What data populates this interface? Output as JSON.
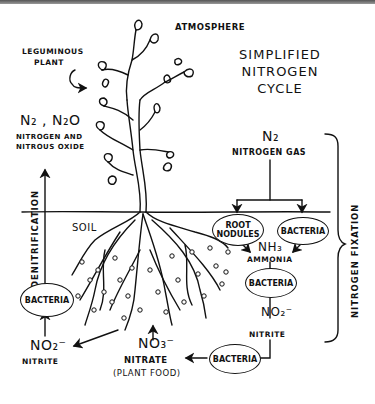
{
  "diagram": {
    "title": "SIMPLIFIED NITROGEN CYCLE",
    "title_lines": [
      "SIMPLIFIED",
      "NITROGEN",
      "CYCLE"
    ],
    "labels": {
      "atmosphere": "ATMOSPHERE",
      "leguminous_plant_1": "LEGUMINOUS",
      "leguminous_plant_2": "PLANT",
      "soil": "SOIL",
      "n2_n2o": "N₂ , N₂O",
      "n2_n2o_name_1": "NITROGEN AND",
      "n2_n2o_name_2": "NITROUS OXIDE",
      "n2": "N₂",
      "n2_name": "NITROGEN GAS",
      "nh3": "NH₃",
      "nh3_name": "AMMONIA",
      "no2_right": "NO₂⁻",
      "no2_right_name": "NITRITE",
      "no2_left": "NO₂⁻",
      "no2_left_name": "NITRITE",
      "no3": "NO₃⁻",
      "no3_name": "NITRATE",
      "no3_note": "(PLANT FOOD)",
      "denitrification": "DENITRIFICATION",
      "nitrogen_fixation": "NITROGEN FIXATION"
    },
    "nodes": {
      "root_nodules": "ROOT NODULES",
      "bacteria_fixation": "BACTERIA",
      "bacteria_nitrification_1": "BACTERIA",
      "bacteria_nitrification_2": "BACTERIA",
      "bacteria_denitrification": "BACTERIA"
    },
    "edges": [
      {
        "from": "N₂ nitrogen gas",
        "to": "root nodules"
      },
      {
        "from": "N₂ nitrogen gas",
        "to": "bacteria (fixation)"
      },
      {
        "from": "root nodules",
        "to": "NH₃ ammonia"
      },
      {
        "from": "bacteria (fixation)",
        "to": "NH₃ ammonia"
      },
      {
        "from": "NH₃ ammonia",
        "to": "bacteria"
      },
      {
        "from": "bacteria",
        "to": "NO₂⁻ nitrite"
      },
      {
        "from": "NO₂⁻ nitrite",
        "to": "bacteria"
      },
      {
        "from": "bacteria",
        "to": "NO₃⁻ nitrate (plant food)"
      },
      {
        "from": "NO₃⁻ nitrate",
        "to": "plant roots"
      },
      {
        "from": "plant roots",
        "to": "NO₂⁻ nitrite (left)"
      },
      {
        "from": "NO₂⁻ nitrite (left)",
        "to": "bacteria (denitrification)"
      },
      {
        "from": "bacteria (denitrification)",
        "to": "N₂, N₂O nitrogen and nitrous oxide"
      }
    ]
  }
}
